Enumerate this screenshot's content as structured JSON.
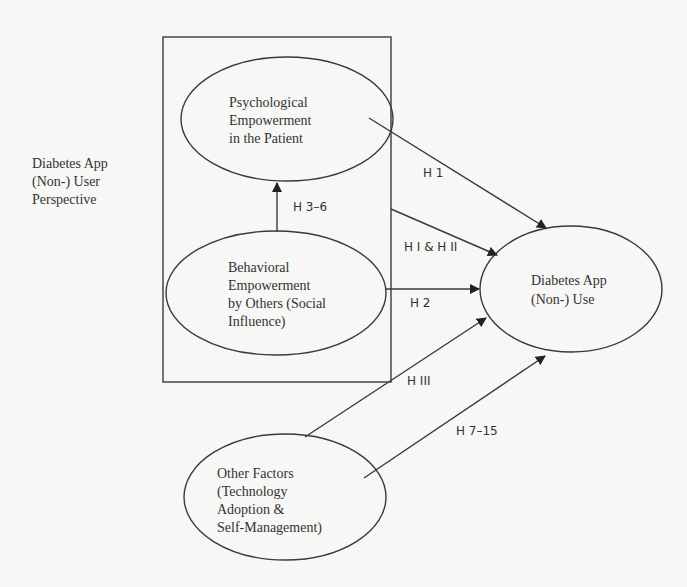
{
  "perspective_label": [
    "Diabetes App",
    "(Non-) User",
    "Perspective"
  ],
  "nodes": {
    "psychological": [
      "Psychological",
      "Empowerment",
      "in the Patient"
    ],
    "behavioral": [
      "Behavioral",
      "Empowerment",
      "by Others (Social",
      "Influence)"
    ],
    "app_use": [
      "Diabetes App",
      "(Non-) Use"
    ],
    "other": [
      "Other Factors",
      "(Technology",
      "Adoption &",
      "Self-Management)"
    ]
  },
  "edges": {
    "h1": "H 1",
    "h3_6": "H 3–6",
    "hI_hII": "H I & H II",
    "h2": "H 2",
    "hIII": "H III",
    "h7_15": "H 7–15"
  }
}
